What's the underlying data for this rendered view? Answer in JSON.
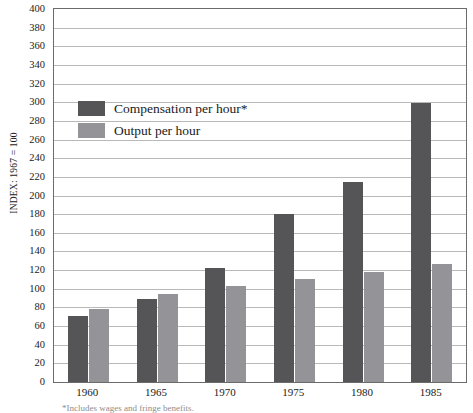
{
  "chart_data": {
    "type": "bar",
    "title": "",
    "subtitle": "",
    "xlabel": "",
    "ylabel": "INDEX: 1967 = 100",
    "ylim": [
      0,
      400
    ],
    "ytick_step": 20,
    "grid": true,
    "legend_position": "inside-upper-left",
    "categories": [
      "1960",
      "1965",
      "1970",
      "1975",
      "1980",
      "1985"
    ],
    "series": [
      {
        "name": "Compensation per hour*",
        "color": "#555558",
        "values": [
          71,
          89,
          122,
          180,
          214,
          299
        ]
      },
      {
        "name": "Output per hour",
        "color": "#949498",
        "values": [
          78,
          94,
          103,
          110,
          118,
          127
        ]
      }
    ],
    "ytick_labels": [
      "400",
      "380",
      "360",
      "340",
      "320",
      "300",
      "280",
      "260",
      "240",
      "220",
      "200",
      "180",
      "160",
      "140",
      "120",
      "100",
      "80",
      "60",
      "40",
      "20",
      "0"
    ]
  },
  "axis": {
    "y_title": "INDEX: 1967 = 100"
  },
  "legend": {
    "items": [
      {
        "label": "Compensation per hour*",
        "color": "#555558"
      },
      {
        "label": "Output per hour",
        "color": "#949498"
      }
    ]
  },
  "footnote": {
    "text": "*Includes wages and fringe benefits."
  },
  "colors": {
    "compensation": "#555558",
    "output": "#949498",
    "gridline": "#b9b9b9",
    "axis_border": "#6b6b6b",
    "text": "#1a1a1a",
    "background": "#ffffff"
  }
}
